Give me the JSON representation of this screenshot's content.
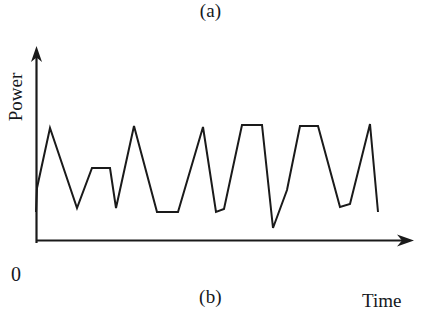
{
  "figure": {
    "caption_top": "(a)",
    "caption_bottom": "(b)",
    "origin_label": "0",
    "y_axis_label": "Power",
    "x_axis_label": "Time",
    "line_color": "#1a1a1a",
    "axis_color": "#1a1a1a",
    "background_color": "#ffffff"
  },
  "chart_data": {
    "type": "line",
    "title": "",
    "subtitle": "",
    "xlabel": "Time",
    "ylabel": "Power",
    "grid": false,
    "legend": null,
    "annotations": [
      "(a)",
      "(b)"
    ],
    "axis_style": "arrow-headed open axes, no tick marks, no tick labels",
    "origin_tick_label": "0",
    "xlim": [
      0,
      100
    ],
    "ylim": [
      0,
      100
    ],
    "series": [
      {
        "name": "Power",
        "x": [
          0,
          0,
          7,
          17,
          26,
          34,
          38,
          47,
          52,
          62,
          71,
          80,
          88,
          97,
          104,
          113,
          122,
          132,
          141,
          149,
          155,
          162,
          170,
          181,
          190,
          199,
          207,
          216,
          224,
          233,
          241,
          249,
          257,
          266,
          274,
          283,
          291,
          300,
          309,
          318,
          327,
          335,
          344,
          352,
          361,
          370,
          379,
          388,
          397,
          406
        ],
        "y": [
          21,
          37,
          43,
          53,
          63,
          73,
          76,
          67,
          58,
          45,
          33,
          23,
          21,
          28,
          41,
          50,
          51,
          51,
          43,
          32,
          22,
          18,
          18,
          28,
          41,
          54,
          67,
          78,
          79,
          65,
          50,
          36,
          22,
          18,
          30,
          45,
          60,
          74,
          82,
          82,
          82,
          71,
          58,
          45,
          33,
          22,
          12,
          17,
          25,
          27
        ]
      }
    ],
    "waveform_points_pixels": [
      [
        36,
        212
      ],
      [
        37,
        188
      ],
      [
        50,
        128
      ],
      [
        77,
        208
      ],
      [
        92,
        168
      ],
      [
        110,
        168
      ],
      [
        116,
        208
      ],
      [
        134,
        126
      ],
      [
        157,
        212
      ],
      [
        178,
        212
      ],
      [
        203,
        127
      ],
      [
        216,
        212
      ],
      [
        224,
        209
      ],
      [
        242,
        125
      ],
      [
        262,
        125
      ],
      [
        273,
        228
      ],
      [
        287,
        190
      ],
      [
        300,
        126
      ],
      [
        318,
        126
      ],
      [
        340,
        207
      ],
      [
        350,
        204
      ],
      [
        370,
        124
      ],
      [
        378,
        212
      ]
    ],
    "peaks": [
      {
        "index": 1,
        "shape": "sharp",
        "height_rel": 0.95
      },
      {
        "index": 2,
        "shape": "flat-top",
        "height_rel": 0.52
      },
      {
        "index": 3,
        "shape": "sharp",
        "height_rel": 0.98
      },
      {
        "index": 4,
        "shape": "sharp",
        "height_rel": 0.97
      },
      {
        "index": 5,
        "shape": "flat-top",
        "height_rel": 1.0
      },
      {
        "index": 6,
        "shape": "flat-top",
        "height_rel": 0.99
      },
      {
        "index": 7,
        "shape": "sharp",
        "height_rel": 1.0
      }
    ],
    "troughs": [
      {
        "index": 1,
        "shape": "sharp",
        "height_rel": 0.05
      },
      {
        "index": 2,
        "shape": "sharp",
        "height_rel": 0.05
      },
      {
        "index": 3,
        "shape": "flat-bottom",
        "height_rel": 0.0
      },
      {
        "index": 4,
        "shape": "sharp",
        "height_rel": 0.0
      },
      {
        "index": 5,
        "shape": "sharp",
        "height_rel": -0.18
      },
      {
        "index": 6,
        "shape": "flat-bottom",
        "height_rel": 0.03
      },
      {
        "index": 7,
        "shape": "end",
        "height_rel": 0.0
      }
    ]
  }
}
